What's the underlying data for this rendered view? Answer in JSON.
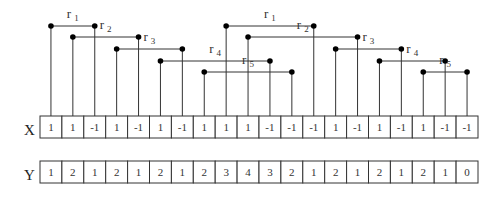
{
  "diagram": {
    "rows": [
      {
        "label": "X",
        "values": [
          "1",
          "1",
          "-1",
          "1",
          "-1",
          "1",
          "-1",
          "1",
          "1",
          "1",
          "-1",
          "-1",
          "-1",
          "1",
          "-1",
          "1",
          "-1",
          "1",
          "-1",
          "-1"
        ]
      },
      {
        "label": "Y",
        "values": [
          "1",
          "2",
          "1",
          "2",
          "1",
          "2",
          "1",
          "2",
          "3",
          "4",
          "3",
          "2",
          "1",
          "2",
          "1",
          "2",
          "1",
          "2",
          "1",
          "0"
        ]
      }
    ],
    "connectors": [
      {
        "name": "r",
        "sub": "1",
        "from": 0,
        "to": 2,
        "level": 0
      },
      {
        "name": "r",
        "sub": "2",
        "from": 1,
        "to": 4,
        "level": 1
      },
      {
        "name": "r",
        "sub": "3",
        "from": 3,
        "to": 6,
        "level": 2
      },
      {
        "name": "r",
        "sub": "4",
        "from": 5,
        "to": 10,
        "level": 3
      },
      {
        "name": "r",
        "sub": "5",
        "from": 7,
        "to": 11,
        "level": 4
      },
      {
        "name": "r",
        "sub": "1",
        "from": 8,
        "to": 12,
        "level": 0
      },
      {
        "name": "r",
        "sub": "2",
        "from": 9,
        "to": 14,
        "level": 1
      },
      {
        "name": "r",
        "sub": "3",
        "from": 13,
        "to": 16,
        "level": 2
      },
      {
        "name": "r",
        "sub": "4",
        "from": 15,
        "to": 18,
        "level": 3
      },
      {
        "name": "r",
        "sub": "5",
        "from": 17,
        "to": 19,
        "level": 4
      }
    ],
    "colors": {
      "line": "#333333",
      "dot": "#000000",
      "background": "#ffffff"
    }
  }
}
